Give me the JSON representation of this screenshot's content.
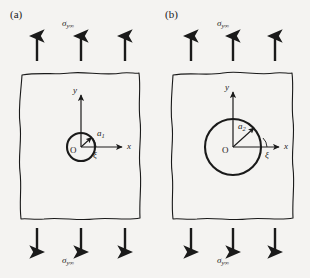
{
  "figure": {
    "background_color": "#f4f3f1",
    "ink_color": "#1a1a1a",
    "panels": [
      {
        "id": "a",
        "label": "(a)",
        "stress_top_label": "σ",
        "stress_top_subscript": "y∞",
        "stress_bottom_label": "σ",
        "stress_bottom_subscript": "y∞",
        "arrows_top_count": 3,
        "arrows_bottom_count": 3,
        "arrow_direction_top": "up",
        "arrow_direction_bottom": "down",
        "hole": {
          "radius_label": "a",
          "radius_subscript": "1",
          "radius_px": 14,
          "center_label": "O"
        },
        "axes": {
          "x_label": "x",
          "y_label": "y"
        },
        "angle_label": "ξ"
      },
      {
        "id": "b",
        "label": "(b)",
        "stress_top_label": "σ",
        "stress_top_subscript": "y∞",
        "stress_bottom_label": "σ",
        "stress_bottom_subscript": "y∞",
        "arrows_top_count": 3,
        "arrows_bottom_count": 3,
        "arrow_direction_top": "up",
        "arrow_direction_bottom": "down",
        "hole": {
          "radius_label": "a",
          "radius_subscript": "2",
          "radius_px": 28,
          "center_label": "O"
        },
        "axes": {
          "x_label": "x",
          "y_label": "y"
        },
        "angle_label": "ξ"
      }
    ]
  }
}
